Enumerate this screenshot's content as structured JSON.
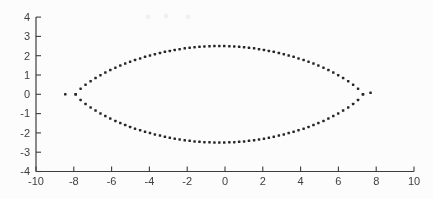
{
  "figure_style": {
    "background": "#fcfcfc",
    "axis_color": "#3d3d3d",
    "label_color": "#3f3f3f",
    "dot_color": "#262626",
    "tick_len_px": 5,
    "font_size_px": 11
  },
  "chart_data": {
    "type": "scatter",
    "title": "",
    "xlabel": "",
    "ylabel": "",
    "xlim": [
      -10,
      10
    ],
    "ylim": [
      -4,
      4
    ],
    "x_ticks": [
      -10,
      -8,
      -6,
      -4,
      -2,
      0,
      2,
      4,
      6,
      8,
      10
    ],
    "y_ticks": [
      -4,
      -3,
      -2,
      -1,
      0,
      1,
      2,
      3,
      4
    ],
    "grid": false,
    "legend_position": "none",
    "marker": {
      "shape": "point",
      "size_px": 2.5
    },
    "series": [
      {
        "name": "upper-arc",
        "x": [
          -7.9,
          -7.64,
          -7.38,
          -7.11,
          -6.85,
          -6.59,
          -6.33,
          -6.07,
          -5.8,
          -5.54,
          -5.28,
          -5.02,
          -4.76,
          -4.49,
          -4.23,
          -3.97,
          -3.71,
          -3.44,
          -3.18,
          -2.92,
          -2.66,
          -2.4,
          -2.13,
          -1.87,
          -1.61,
          -1.35,
          -1.09,
          -0.82,
          -0.56,
          -0.3,
          -0.04,
          0.23,
          0.49,
          0.75,
          1.01,
          1.27,
          1.54,
          1.8,
          2.06,
          2.32,
          2.58,
          2.85,
          3.11,
          3.37,
          3.63,
          3.89,
          4.16,
          4.42,
          4.68,
          4.94,
          5.21,
          5.47,
          5.73,
          5.99,
          6.25,
          6.52,
          6.78,
          7.04,
          7.3
        ],
        "y": [
          0.0,
          0.29,
          0.5,
          0.68,
          0.84,
          0.99,
          1.13,
          1.26,
          1.38,
          1.49,
          1.59,
          1.69,
          1.78,
          1.86,
          1.94,
          2.01,
          2.08,
          2.14,
          2.2,
          2.25,
          2.3,
          2.34,
          2.38,
          2.41,
          2.44,
          2.46,
          2.48,
          2.49,
          2.5,
          2.5,
          2.5,
          2.49,
          2.48,
          2.46,
          2.44,
          2.41,
          2.38,
          2.34,
          2.3,
          2.25,
          2.2,
          2.14,
          2.08,
          2.01,
          1.94,
          1.86,
          1.78,
          1.69,
          1.59,
          1.49,
          1.38,
          1.26,
          1.13,
          0.99,
          0.84,
          0.68,
          0.5,
          0.29,
          0.0
        ]
      },
      {
        "name": "lower-arc",
        "x": [
          -7.9,
          -7.64,
          -7.38,
          -7.11,
          -6.85,
          -6.59,
          -6.33,
          -6.07,
          -5.8,
          -5.54,
          -5.28,
          -5.02,
          -4.76,
          -4.49,
          -4.23,
          -3.97,
          -3.71,
          -3.44,
          -3.18,
          -2.92,
          -2.66,
          -2.4,
          -2.13,
          -1.87,
          -1.61,
          -1.35,
          -1.09,
          -0.82,
          -0.56,
          -0.3,
          -0.04,
          0.23,
          0.49,
          0.75,
          1.01,
          1.27,
          1.54,
          1.8,
          2.06,
          2.32,
          2.58,
          2.85,
          3.11,
          3.37,
          3.63,
          3.89,
          4.16,
          4.42,
          4.68,
          4.94,
          5.21,
          5.47,
          5.73,
          5.99,
          6.25,
          6.52,
          6.78,
          7.04,
          7.3
        ],
        "y": [
          0.0,
          -0.29,
          -0.5,
          -0.68,
          -0.84,
          -0.99,
          -1.13,
          -1.26,
          -1.38,
          -1.49,
          -1.59,
          -1.69,
          -1.78,
          -1.86,
          -1.94,
          -2.01,
          -2.08,
          -2.14,
          -2.2,
          -2.25,
          -2.3,
          -2.34,
          -2.38,
          -2.41,
          -2.44,
          -2.46,
          -2.48,
          -2.49,
          -2.5,
          -2.5,
          -2.5,
          -2.49,
          -2.48,
          -2.46,
          -2.44,
          -2.41,
          -2.38,
          -2.34,
          -2.3,
          -2.25,
          -2.2,
          -2.14,
          -2.08,
          -2.01,
          -1.94,
          -1.86,
          -1.78,
          -1.69,
          -1.59,
          -1.49,
          -1.38,
          -1.26,
          -1.13,
          -0.99,
          -0.84,
          -0.68,
          -0.5,
          -0.29,
          0.0
        ]
      },
      {
        "name": "real-axis-outliers",
        "x": [
          -8.45,
          7.7
        ],
        "y": [
          0.0,
          0.08
        ]
      }
    ]
  },
  "scan_artifacts_px": [
    {
      "x": 148,
      "y": 17
    },
    {
      "x": 166,
      "y": 16
    },
    {
      "x": 188,
      "y": 17
    }
  ]
}
